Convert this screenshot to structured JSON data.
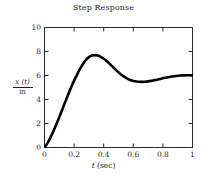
{
  "chart_data": {
    "type": "line",
    "title": "Step Response",
    "xlabel": "t (sec)",
    "ylabel": "x (t) / in",
    "ylabel_numerator_var": "x",
    "ylabel_numerator_arg": "(t)",
    "ylabel_denominator": "in",
    "xlabel_var": "t",
    "xlabel_unit": "(sec)",
    "xlim": [
      0,
      1
    ],
    "ylim": [
      0,
      10
    ],
    "xticks": [
      0,
      0.2,
      0.4,
      0.6,
      0.8,
      1
    ],
    "xtick_labels": [
      "0",
      "0.2",
      "0.4",
      "0.6",
      "0.8",
      "1"
    ],
    "yticks": [
      0,
      2,
      4,
      6,
      8,
      10
    ],
    "ytick_labels": [
      "0",
      "2",
      "4",
      "6",
      "8",
      "10"
    ],
    "grid": false,
    "legend": null,
    "frame": "box",
    "tick_direction": "in",
    "line_color": "#000000",
    "line_width": 2.6,
    "series": [
      {
        "name": "x(t)/in",
        "x": [
          0.0,
          0.02,
          0.04,
          0.06,
          0.08,
          0.1,
          0.12,
          0.14,
          0.16,
          0.18,
          0.2,
          0.22,
          0.24,
          0.26,
          0.28,
          0.3,
          0.32,
          0.34,
          0.36,
          0.38,
          0.4,
          0.42,
          0.44,
          0.46,
          0.48,
          0.5,
          0.52,
          0.54,
          0.56,
          0.58,
          0.6,
          0.62,
          0.64,
          0.66,
          0.68,
          0.7,
          0.72,
          0.74,
          0.76,
          0.78,
          0.8,
          0.82,
          0.84,
          0.86,
          0.88,
          0.9,
          0.92,
          0.94,
          0.96,
          0.98,
          1.0
        ],
        "y": [
          0.0,
          0.36,
          0.82,
          1.35,
          1.93,
          2.54,
          3.17,
          3.8,
          4.42,
          5.01,
          5.57,
          6.08,
          6.55,
          6.96,
          7.3,
          7.53,
          7.66,
          7.7,
          7.66,
          7.56,
          7.4,
          7.2,
          6.98,
          6.74,
          6.5,
          6.27,
          6.06,
          5.89,
          5.74,
          5.63,
          5.55,
          5.5,
          5.48,
          5.47,
          5.48,
          5.51,
          5.55,
          5.6,
          5.65,
          5.71,
          5.77,
          5.82,
          5.87,
          5.91,
          5.95,
          5.98,
          6.0,
          6.01,
          6.02,
          6.02,
          6.01
        ]
      }
    ],
    "annotations": {
      "peak_value": 7.7,
      "peak_time": 0.33,
      "trough_value": 5.47,
      "trough_time": 0.66,
      "final_value": 6.0
    }
  }
}
